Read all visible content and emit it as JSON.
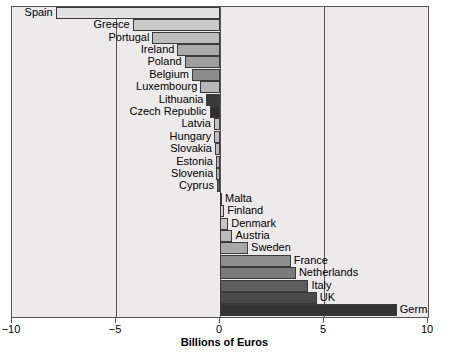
{
  "chart_data": {
    "type": "bar",
    "orientation": "horizontal",
    "title": "",
    "xlabel": "Billions of Euros",
    "ylabel": "",
    "xlim": [
      -10,
      10
    ],
    "xticks": [
      -10,
      -5,
      0,
      5,
      10
    ],
    "xticklabels": [
      "−10",
      "−5",
      "0",
      "5",
      "10"
    ],
    "grid": true,
    "legend": null,
    "categories": [
      "Spain",
      "Greece",
      "Portugal",
      "Ireland",
      "Poland",
      "Belgium",
      "Luxembourg",
      "Lithuania",
      "Czech Republic",
      "Latvia",
      "Hungary",
      "Slovakia",
      "Estonia",
      "Slovenia",
      "Cyprus",
      "Malta",
      "Finland",
      "Denmark",
      "Austria",
      "Sweden",
      "France",
      "Netherlands",
      "Italy",
      "UK",
      "Germany"
    ],
    "values": [
      -7.9,
      -4.2,
      -3.25,
      -2.05,
      -1.7,
      -1.35,
      -0.95,
      -0.65,
      -0.5,
      -0.3,
      -0.28,
      -0.25,
      -0.2,
      -0.18,
      -0.15,
      0.08,
      0.2,
      0.4,
      0.6,
      1.35,
      3.4,
      3.65,
      4.25,
      4.65,
      8.5
    ],
    "bar_colors": [
      "#e2e2e2",
      "#c9c9c9",
      "#bdbdbd",
      "#aaaaaa",
      "#9e9e9e",
      "#8c8c8c",
      "#b8b8b8",
      "#3a3a3a",
      "#2f2f2f",
      "#c4c4c4",
      "#bfbfbf",
      "#bababa",
      "#b5b5b5",
      "#b0b0b0",
      "#6a6a6a",
      "#d8d8d8",
      "#d2d2d2",
      "#c6c6c6",
      "#bcbcbc",
      "#a8a8a8",
      "#8e8e8e",
      "#7a7a7a",
      "#5e5e5e",
      "#4a4a4a",
      "#333333"
    ],
    "label_side": [
      "left",
      "left",
      "left",
      "left",
      "left",
      "left",
      "left",
      "left",
      "left",
      "left",
      "left",
      "left",
      "left",
      "left",
      "left",
      "right",
      "right",
      "right",
      "right",
      "right",
      "right",
      "right",
      "right",
      "right",
      "right"
    ]
  },
  "axis": {
    "title": "Billions of Euros"
  }
}
